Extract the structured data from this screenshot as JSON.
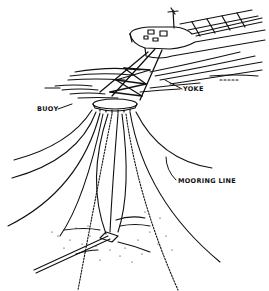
{
  "figure": {
    "type": "technical-illustration",
    "labels": {
      "buoy": "BUOY",
      "yoke": "YOKE",
      "mooring_line": "MOORING LINE"
    },
    "colors": {
      "ink": "#111111",
      "background": "#ffffff"
    }
  }
}
